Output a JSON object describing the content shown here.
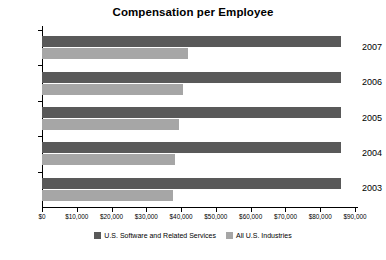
{
  "chart_data": {
    "type": "bar",
    "orientation": "horizontal",
    "title": "Compensation per Employee",
    "xlabel": "",
    "ylabel": "",
    "categories": [
      "2007",
      "2006",
      "2005",
      "2004",
      "2003"
    ],
    "series": [
      {
        "name": "U.S. Software and Related Services",
        "color": "#595959",
        "values": [
          86000,
          86000,
          86000,
          86000,
          86000
        ]
      },
      {
        "name": "All U.S. Industries",
        "color": "#a6a6a6",
        "values": [
          42000,
          40500,
          39400,
          38200,
          37700
        ]
      }
    ],
    "xlim": [
      0,
      90000
    ],
    "xticks": [
      0,
      10000,
      20000,
      30000,
      40000,
      50000,
      60000,
      70000,
      80000,
      90000
    ],
    "xtick_labels": [
      "$0",
      "$10,000",
      "$20,000",
      "$30,000",
      "$40,000",
      "$50,000",
      "$60,000",
      "$70,000",
      "$80,000",
      "$90,000"
    ],
    "grid": false,
    "legend_position": "bottom"
  },
  "legend": {
    "entries": [
      {
        "label": "U.S. Software and Related Services",
        "color": "#595959"
      },
      {
        "label": "All U.S. Industries",
        "color": "#a6a6a6"
      }
    ]
  }
}
